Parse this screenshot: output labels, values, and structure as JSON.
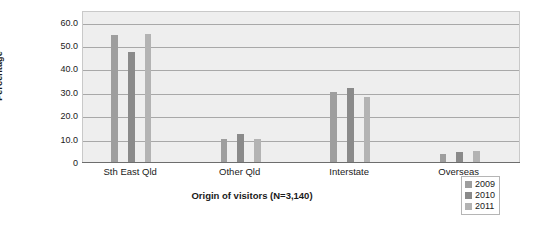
{
  "chart_data": {
    "type": "bar",
    "title": "",
    "subtitle": "",
    "xlabel": "Origin of visitors (N=3,140)",
    "ylabel": "Percentage",
    "categories": [
      "Sth East Qld",
      "Other Qld",
      "Interstate",
      "Overseas"
    ],
    "series": [
      {
        "name": "2009",
        "color": "#9e9e9e",
        "values": [
          54.3,
          10.0,
          29.8,
          3.6
        ]
      },
      {
        "name": "2010",
        "color": "#8a8a8a",
        "values": [
          46.9,
          12.0,
          31.5,
          4.2
        ]
      },
      {
        "name": "2011",
        "color": "#b3b3b3",
        "values": [
          54.6,
          9.9,
          28.0,
          4.5
        ]
      }
    ],
    "ylim": [
      0,
      65
    ],
    "yticks": [
      "60.0",
      "50.0",
      "40.0",
      "30.0",
      "20.0",
      "10.0",
      "0"
    ],
    "ytick_values": [
      60,
      50,
      40,
      30,
      20,
      10,
      0
    ],
    "grid": true,
    "grid_axis": "y",
    "legend_position": "bottom-right",
    "legend_entries": [
      "2009",
      "2010",
      "2011"
    ],
    "plot_background": "#eeeeee",
    "gridline_color": "#a8a8a8",
    "axis_color": "#6d6d6d"
  }
}
